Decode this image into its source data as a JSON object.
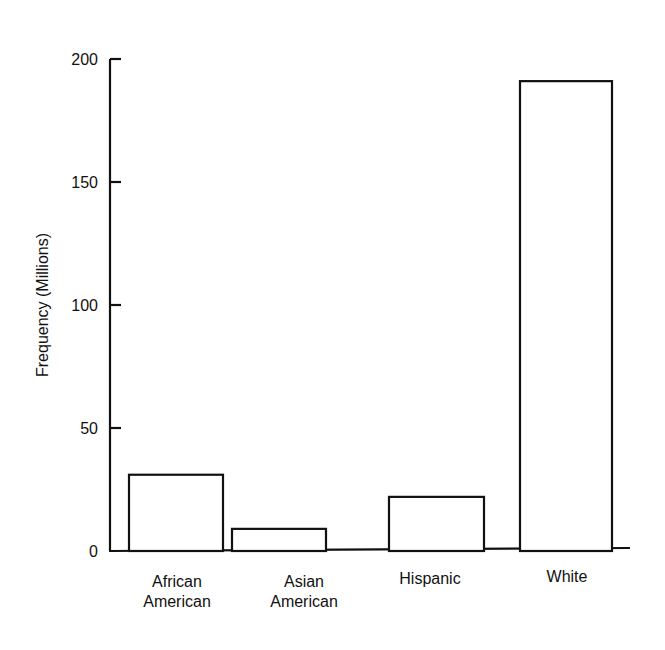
{
  "chart_data": {
    "type": "bar",
    "title": "",
    "xlabel": "",
    "ylabel": "Frequency (Millions)",
    "categories": [
      [
        "African",
        "American"
      ],
      [
        "Asian",
        "American"
      ],
      [
        "Hispanic"
      ],
      [
        "White"
      ]
    ],
    "category_names": [
      "African American",
      "Asian American",
      "Hispanic",
      "White"
    ],
    "values": [
      31,
      9,
      22,
      191
    ],
    "ylim": [
      0,
      200
    ],
    "yticks": [
      0,
      50,
      100,
      150,
      200
    ],
    "grid": false,
    "legend": null,
    "bar_fill": "#ffffff",
    "bar_stroke": "#111111"
  }
}
